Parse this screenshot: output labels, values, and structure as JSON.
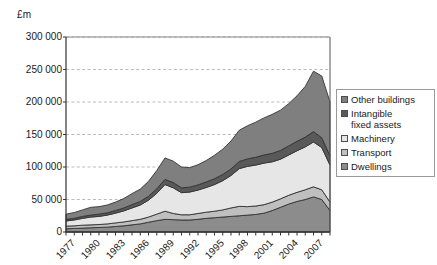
{
  "axis_title": "£m",
  "legend": {
    "position": "right",
    "entries": [
      {
        "label": "Other buildings",
        "color": "#7f7f7f",
        "name": "other-buildings"
      },
      {
        "label": "Intangible\nfixed assets",
        "color": "#595959",
        "name": "intangible-fixed-assets"
      },
      {
        "label": "Machinery",
        "color": "#e6e6e6",
        "name": "machinery"
      },
      {
        "label": "Transport",
        "color": "#bfbfbf",
        "name": "transport"
      },
      {
        "label": "Dwellings",
        "color": "#8c8c8c",
        "name": "dwellings"
      }
    ]
  },
  "y_ticks": [
    "0",
    "50 000",
    "100 000",
    "150 000",
    "200 000",
    "250 000",
    "300 000"
  ],
  "x_ticks": [
    "1977",
    "1980",
    "1983",
    "1986",
    "1989",
    "1992",
    "1995",
    "1998",
    "2001",
    "2004",
    "2007"
  ],
  "chart_data": {
    "type": "area",
    "title": "",
    "xlabel": "",
    "ylabel": "£m",
    "ylim": [
      0,
      300000
    ],
    "ytick_step": 50000,
    "grid": true,
    "stacked": true,
    "x": [
      1977,
      1978,
      1979,
      1980,
      1981,
      1982,
      1983,
      1984,
      1985,
      1986,
      1987,
      1988,
      1989,
      1990,
      1991,
      1992,
      1993,
      1994,
      1995,
      1996,
      1997,
      1998,
      1999,
      2000,
      2001,
      2002,
      2003,
      2004,
      2005,
      2006,
      2007,
      2008,
      2009
    ],
    "x_tick_labels": [
      "1977",
      "1980",
      "1983",
      "1986",
      "1989",
      "1992",
      "1995",
      "1998",
      "2001",
      "2004",
      "2007"
    ],
    "series": [
      {
        "name": "Dwellings",
        "color": "#8c8c8c",
        "values": [
          5000,
          5500,
          6000,
          6500,
          7000,
          7500,
          8500,
          9500,
          11000,
          12500,
          15000,
          17500,
          19500,
          19000,
          18500,
          18500,
          19500,
          21000,
          22000,
          23000,
          24000,
          25000,
          26000,
          27000,
          29000,
          33000,
          38000,
          43000,
          47000,
          50000,
          54000,
          50000,
          33000
        ]
      },
      {
        "name": "Transport",
        "color": "#bfbfbf",
        "values": [
          4000,
          4000,
          4500,
          4500,
          4500,
          5000,
          5500,
          6000,
          6500,
          7000,
          8000,
          10000,
          12500,
          9500,
          8000,
          8000,
          9000,
          9500,
          10000,
          11000,
          13000,
          14500,
          13000,
          13000,
          13000,
          13000,
          13000,
          13500,
          14000,
          15000,
          15500,
          15000,
          13000
        ]
      },
      {
        "name": "Machinery",
        "color": "#e6e6e6",
        "values": [
          8000,
          9000,
          10500,
          12000,
          12500,
          13500,
          15000,
          17000,
          19500,
          22000,
          26000,
          32000,
          41000,
          39500,
          34000,
          35000,
          36000,
          38000,
          41000,
          45000,
          50000,
          58000,
          62000,
          63000,
          64000,
          62000,
          61000,
          62000,
          64000,
          66000,
          69000,
          65000,
          57000
        ]
      },
      {
        "name": "Intangible fixed assets",
        "color": "#595959",
        "values": [
          2500,
          2500,
          3000,
          3000,
          3500,
          3500,
          4000,
          4500,
          5000,
          5500,
          6000,
          7000,
          8000,
          8000,
          7500,
          7500,
          8000,
          8500,
          9000,
          9500,
          10000,
          11000,
          11500,
          12000,
          12500,
          13000,
          13500,
          14000,
          14500,
          15000,
          16000,
          15000,
          14000
        ]
      },
      {
        "name": "Other buildings",
        "color": "#7f7f7f",
        "values": [
          8000,
          9000,
          10000,
          12000,
          11500,
          12000,
          13000,
          14500,
          17000,
          19000,
          23000,
          28000,
          33000,
          33000,
          32000,
          30000,
          31000,
          33000,
          36000,
          39000,
          43000,
          48000,
          51000,
          54000,
          57000,
          60000,
          62000,
          65000,
          70000,
          78000,
          93000,
          95000,
          83000
        ]
      }
    ],
    "annotations": {
      "peak_total_year": 2008,
      "peak_total_value": 248000,
      "final_total_value": 200000
    }
  }
}
